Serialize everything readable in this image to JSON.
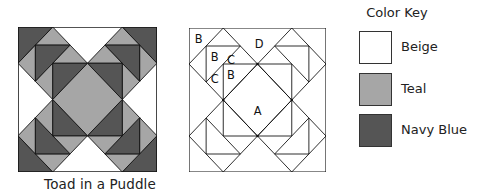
{
  "diagram": {
    "title": "Toad in a Puddle",
    "colored_block": {
      "caption": "Toad in a Puddle"
    },
    "labeled_block": {
      "piece_labels": [
        {
          "label": "B",
          "x": 10,
          "y": 20
        },
        {
          "label": "B",
          "x": 28,
          "y": 44
        },
        {
          "label": "C",
          "x": 46,
          "y": 40
        },
        {
          "label": "D",
          "x": 75,
          "y": 20
        },
        {
          "label": "C",
          "x": 28,
          "y": 66
        },
        {
          "label": "B",
          "x": 42,
          "y": 62
        },
        {
          "label": "A",
          "x": 73,
          "y": 86
        }
      ]
    },
    "color_key": {
      "title": "Color Key",
      "entries": [
        {
          "label": "Beige",
          "color": "#ffffff"
        },
        {
          "label": "Teal",
          "color": "#a6a6a6"
        },
        {
          "label": "Navy Blue",
          "color": "#555555"
        }
      ]
    }
  },
  "colors": {
    "beige": "#ffffff",
    "teal": "#a6a6a6",
    "navy": "#555555",
    "line": "#111111"
  }
}
